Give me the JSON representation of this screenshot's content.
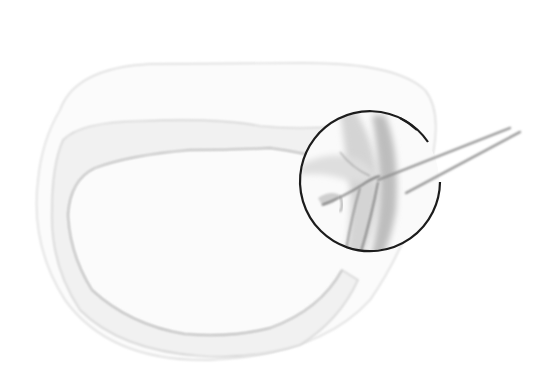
{
  "figure": {
    "type": "medical-illustration",
    "labels": [],
    "colors": {
      "background": "#ffffff",
      "outline_light": "#d8d8d8",
      "outline_mid": "#c4c4c4",
      "vessel": "#8a8a8a",
      "magnifier_ring": "#1a1a1a",
      "forceps": "#9a9a9a"
    },
    "magnifier": {
      "cx": 370,
      "cy": 181,
      "r": 70
    }
  }
}
